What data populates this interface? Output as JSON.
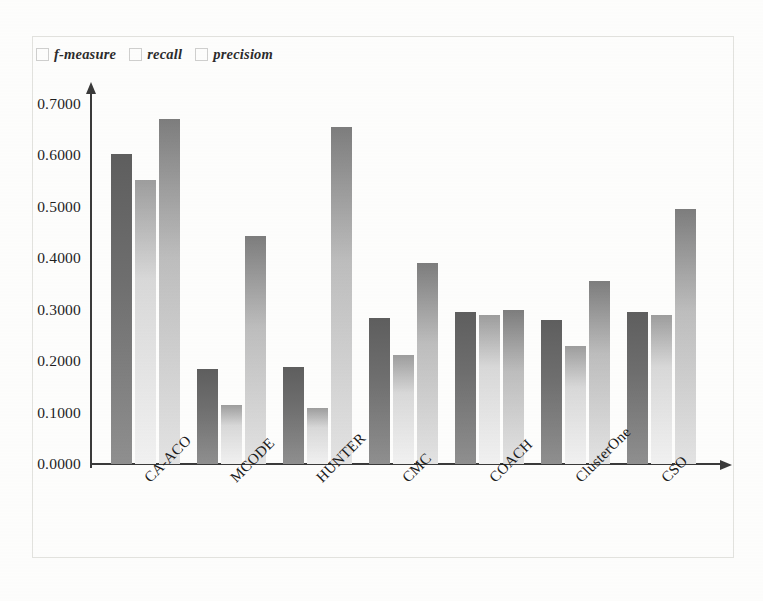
{
  "chart_data": {
    "type": "bar",
    "title": "",
    "xlabel": "",
    "ylabel": "",
    "ylim": [
      0.0,
      0.7
    ],
    "grid": false,
    "legend_position": "top-left",
    "categories": [
      "CA-ACO",
      "MCODE",
      "HUNTER",
      "CMC",
      "COACH",
      "ClusterOne",
      "CSO"
    ],
    "y_ticks": [
      "0.0000",
      "0.1000",
      "0.2000",
      "0.3000",
      "0.4000",
      "0.5000",
      "0.6000",
      "0.7000"
    ],
    "y_tick_values": [
      0.0,
      0.1,
      0.2,
      0.3,
      0.4,
      0.5,
      0.6,
      0.7
    ],
    "series": [
      {
        "name": "f-measure",
        "color": "#6e6e6e",
        "values": [
          0.602,
          0.185,
          0.189,
          0.283,
          0.295,
          0.28,
          0.295
        ]
      },
      {
        "name": "recall",
        "color": "#e8e8e8",
        "values": [
          0.552,
          0.114,
          0.109,
          0.212,
          0.289,
          0.229,
          0.289
        ]
      },
      {
        "name": "precisiom",
        "color": "#c4c4c4",
        "values": [
          0.67,
          0.444,
          0.655,
          0.391,
          0.299,
          0.356,
          0.496
        ]
      }
    ]
  },
  "legend": {
    "items": [
      {
        "label": "f-measure",
        "swatch": "legend-swatch-f-measure"
      },
      {
        "label": "recall",
        "swatch": "legend-swatch-recall"
      },
      {
        "label": "precisiom",
        "swatch": "legend-swatch-precision"
      }
    ]
  }
}
